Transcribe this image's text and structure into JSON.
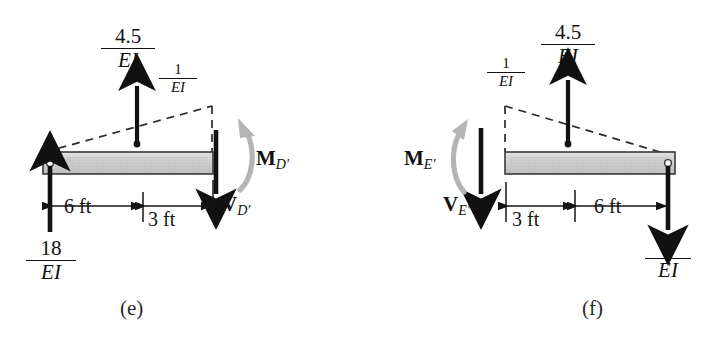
{
  "figure": {
    "background_color": "#ffffff",
    "beam_fill_color": "#c8c8c8",
    "beam_outline_color": "#3a3a3a",
    "arrow_color": "#111111",
    "moment_arrow_color": "#b0b0b0",
    "dashed_line_color": "#2b2b2b"
  },
  "panels": [
    {
      "id": "e",
      "caption": "(e)",
      "labels": {
        "load_peak": {
          "numerator": "4.5",
          "denominator": "EI"
        },
        "load_unit": {
          "numerator": "1",
          "denominator": "EI"
        },
        "reaction": {
          "numerator": "18",
          "denominator": "EI"
        },
        "shear": {
          "bold": "V",
          "sub": "D′"
        },
        "moment": {
          "bold": "M",
          "sub": "D′"
        },
        "dim_left": "6 ft",
        "dim_right": "3 ft"
      }
    },
    {
      "id": "f",
      "caption": "(f)",
      "labels": {
        "load_peak": {
          "numerator": "4.5",
          "denominator": "EI"
        },
        "load_unit": {
          "numerator": "1",
          "denominator": "EI"
        },
        "reaction": {
          "numerator": "6",
          "denominator": "EI"
        },
        "shear": {
          "bold": "V",
          "sub": "E′"
        },
        "moment": {
          "bold": "M",
          "sub": "E′"
        },
        "dim_left": "3 ft",
        "dim_right": "6 ft"
      }
    }
  ]
}
